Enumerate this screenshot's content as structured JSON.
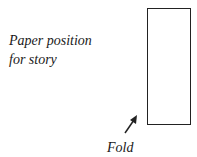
{
  "labels": {
    "line1": "Paper position",
    "line2": "for story",
    "fold": "Fold"
  },
  "colors": {
    "stroke": "#222222",
    "background": "#ffffff"
  }
}
